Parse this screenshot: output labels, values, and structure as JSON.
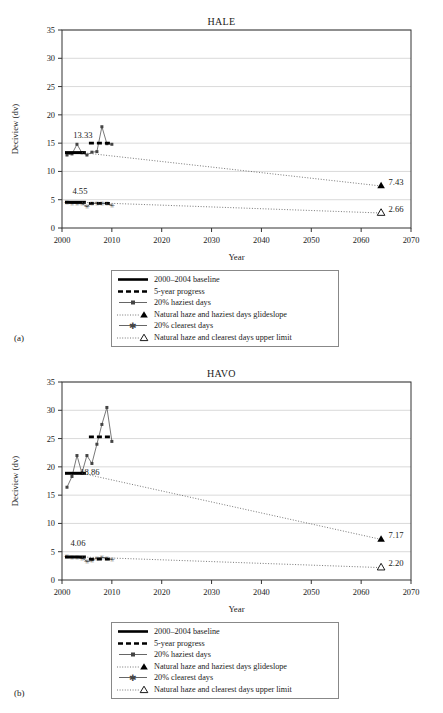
{
  "figure": {
    "panels": [
      {
        "letter": "(a)",
        "title": "HALE"
      },
      {
        "letter": "(b)",
        "title": "HAVO"
      }
    ]
  },
  "legend": {
    "items": [
      {
        "key": "solid-thick-line",
        "label": "2000–2004 baseline"
      },
      {
        "key": "dashed-thick-line",
        "label": "5-year progress"
      },
      {
        "key": "line-square-marker",
        "label": "20% haziest days"
      },
      {
        "key": "dotted-line-filled-triangle",
        "label": "Natural haze and haziest days glideslope"
      },
      {
        "key": "line-star-marker",
        "label": "20% clearest days"
      },
      {
        "key": "dotted-line-open-triangle",
        "label": "Natural haze and clearest days upper limit"
      }
    ]
  },
  "chart_data": [
    {
      "type": "line",
      "title": "HALE",
      "panel": "(a)",
      "xlabel": "Year",
      "ylabel": "Deciview (dv)",
      "xlim": [
        2000,
        2070
      ],
      "ylim": [
        0,
        35
      ],
      "xticks": [
        2000,
        2010,
        2020,
        2030,
        2040,
        2050,
        2060,
        2070
      ],
      "yticks": [
        0,
        5,
        10,
        15,
        20,
        25,
        30,
        35
      ],
      "grid": "horizontal",
      "legend_position": "below-axes",
      "annotations": [
        {
          "text": "13.33",
          "x": 2004.2,
          "y": 15.9,
          "role": "baseline-value-haziest"
        },
        {
          "text": "4.55",
          "x": 2003.6,
          "y": 6.0,
          "role": "baseline-value-clearest"
        },
        {
          "text": "7.43",
          "x": 2065.5,
          "y": 7.6,
          "role": "glideslope-endpoint-haziest"
        },
        {
          "text": "2.66",
          "x": 2065.5,
          "y": 2.8,
          "role": "glideslope-endpoint-clearest"
        }
      ],
      "series": [
        {
          "name": "20% haziest days",
          "style": "line-square-marker",
          "x": [
            2001,
            2002,
            2003,
            2004,
            2005,
            2006,
            2007,
            2008,
            2009,
            2010
          ],
          "values": [
            12.9,
            13.1,
            14.8,
            13.3,
            12.9,
            13.4,
            13.5,
            17.9,
            14.9,
            14.8
          ]
        },
        {
          "name": "20% clearest days",
          "style": "line-star-marker",
          "x": [
            2001,
            2002,
            2003,
            2004,
            2005,
            2006,
            2007,
            2008,
            2009,
            2010
          ],
          "values": [
            4.5,
            4.4,
            4.3,
            4.3,
            3.8,
            4.4,
            4.4,
            4.4,
            4.3,
            4.0
          ]
        },
        {
          "name": "2000–2004 baseline (haziest)",
          "style": "solid-thick-line",
          "x": [
            2000.6,
            2004.8
          ],
          "values": [
            13.33,
            13.33
          ]
        },
        {
          "name": "2000–2004 baseline (clearest)",
          "style": "solid-thick-line",
          "x": [
            2000.6,
            2004.8
          ],
          "values": [
            4.55,
            4.55
          ]
        },
        {
          "name": "5-year progress (haziest)",
          "style": "dashed-thick-line",
          "x": [
            2005.4,
            2010.2
          ],
          "values": [
            15.0,
            15.0
          ]
        },
        {
          "name": "5-year progress (clearest)",
          "style": "dashed-thick-line",
          "x": [
            2005.4,
            2010.2
          ],
          "values": [
            4.35,
            4.35
          ]
        },
        {
          "name": "Natural haze and haziest days glideslope",
          "style": "dotted-line-filled-triangle",
          "x": [
            2004,
            2064
          ],
          "values": [
            13.33,
            7.43
          ]
        },
        {
          "name": "Natural haze and clearest days upper limit",
          "style": "dotted-line-open-triangle",
          "x": [
            2004,
            2064
          ],
          "values": [
            4.55,
            2.66
          ]
        }
      ]
    },
    {
      "type": "line",
      "title": "HAVO",
      "panel": "(b)",
      "xlabel": "Year",
      "ylabel": "Deciview (dv)",
      "xlim": [
        2000,
        2070
      ],
      "ylim": [
        0,
        35
      ],
      "xticks": [
        2000,
        2010,
        2020,
        2030,
        2040,
        2050,
        2060,
        2070
      ],
      "yticks": [
        0,
        5,
        10,
        15,
        20,
        25,
        30,
        35
      ],
      "grid": "horizontal",
      "legend_position": "below-axes",
      "annotations": [
        {
          "text": "18.86",
          "x": 2005.6,
          "y": 18.6,
          "role": "baseline-value-haziest"
        },
        {
          "text": "4.06",
          "x": 2003.2,
          "y": 6.0,
          "role": "baseline-value-clearest"
        },
        {
          "text": "7.17",
          "x": 2065.5,
          "y": 7.5,
          "role": "glideslope-endpoint-haziest"
        },
        {
          "text": "2.20",
          "x": 2065.5,
          "y": 2.4,
          "role": "glideslope-endpoint-clearest"
        }
      ],
      "series": [
        {
          "name": "20% haziest days",
          "style": "line-square-marker",
          "x": [
            2001,
            2002,
            2003,
            2004,
            2005,
            2006,
            2007,
            2008,
            2009,
            2010
          ],
          "values": [
            16.4,
            18.3,
            22.0,
            18.9,
            22.0,
            20.6,
            24.0,
            27.5,
            30.5,
            24.5
          ]
        },
        {
          "name": "20% clearest days",
          "style": "line-star-marker",
          "x": [
            2001,
            2002,
            2003,
            2004,
            2005,
            2006,
            2007,
            2008,
            2009,
            2010
          ],
          "values": [
            4.1,
            4.0,
            4.0,
            3.9,
            3.3,
            3.4,
            3.9,
            4.0,
            3.9,
            3.6
          ]
        },
        {
          "name": "2000–2004 baseline (haziest)",
          "style": "solid-thick-line",
          "x": [
            2000.6,
            2004.8
          ],
          "values": [
            18.86,
            18.86
          ]
        },
        {
          "name": "2000–2004 baseline (clearest)",
          "style": "solid-thick-line",
          "x": [
            2000.6,
            2004.8
          ],
          "values": [
            4.06,
            4.06
          ]
        },
        {
          "name": "5-year progress (haziest)",
          "style": "dashed-thick-line",
          "x": [
            2005.4,
            2010.2
          ],
          "values": [
            25.3,
            25.3
          ]
        },
        {
          "name": "5-year progress (clearest)",
          "style": "dashed-thick-line",
          "x": [
            2005.4,
            2010.2
          ],
          "values": [
            3.7,
            3.7
          ]
        },
        {
          "name": "Natural haze and haziest days glideslope",
          "style": "dotted-line-filled-triangle",
          "x": [
            2004,
            2064
          ],
          "values": [
            18.86,
            7.17
          ]
        },
        {
          "name": "Natural haze and clearest days upper limit",
          "style": "dotted-line-open-triangle",
          "x": [
            2004,
            2064
          ],
          "values": [
            4.06,
            2.2
          ]
        }
      ]
    }
  ]
}
